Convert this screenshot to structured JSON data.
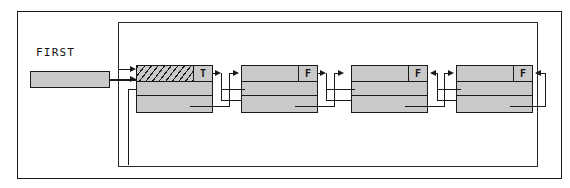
{
  "diagram": {
    "title_label": "FIRST",
    "colors": {
      "node_fill": "#c9c9c9",
      "stroke": "#1a1a1a",
      "background": "#ffffff"
    },
    "outer_frame": {
      "x": 17,
      "y": 11,
      "w": 543,
      "h": 166
    },
    "loop_frame": {
      "x": 118,
      "y": 22,
      "w": 418,
      "h": 143
    },
    "first_pointer": {
      "label": "FIRST",
      "label_x": 36,
      "label_y": 52,
      "box_x": 30,
      "box_y": 71,
      "box_w": 80,
      "box_h": 17
    },
    "node_geometry": {
      "width": 77,
      "height": 48,
      "row_heights": [
        16,
        15,
        17
      ],
      "flag_cell_width": 19,
      "y": 65
    },
    "nodes": [
      {
        "id": "node-1",
        "x": 136,
        "flag": "T",
        "hatched": true,
        "data_label": ""
      },
      {
        "id": "node-2",
        "x": 241,
        "flag": "F",
        "hatched": false,
        "data_label": ""
      },
      {
        "id": "node-3",
        "x": 351,
        "flag": "F",
        "hatched": false,
        "data_label": ""
      },
      {
        "id": "node-4",
        "x": 456,
        "flag": "F",
        "hatched": false,
        "data_label": ""
      }
    ],
    "node_count": 4,
    "flags_sequence": [
      "T",
      "F",
      "F",
      "F"
    ],
    "legend": {
      "flag_true": "T",
      "flag_false": "F"
    }
  }
}
